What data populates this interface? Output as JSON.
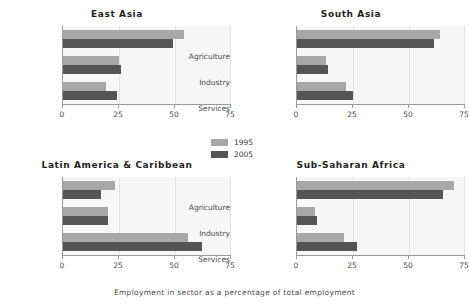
{
  "chart_data": {
    "type": "bar",
    "orientation": "horizontal",
    "title": "",
    "xlabel": "Employment in sector as a percentage of total employment",
    "ylabel": "",
    "xlim": [
      0,
      75
    ],
    "xticks": [
      0,
      25,
      50,
      75
    ],
    "xtick_labels": [
      "0",
      "25",
      "50",
      "75"
    ],
    "categories": [
      "Agriculture",
      "Industry",
      "Services"
    ],
    "legend": {
      "position": "center",
      "entries": [
        {
          "name": "1995",
          "color": "#a8a8a8"
        },
        {
          "name": "2005",
          "color": "#555555"
        }
      ]
    },
    "grid": true,
    "panels": [
      {
        "title": "East Asia",
        "series": [
          {
            "name": "1995",
            "values": [
              54,
              25,
              19
            ]
          },
          {
            "name": "2005",
            "values": [
              49,
              26,
              24
            ]
          }
        ]
      },
      {
        "title": "South Asia",
        "series": [
          {
            "name": "1995",
            "values": [
              64,
              13,
              22
            ]
          },
          {
            "name": "2005",
            "values": [
              61,
              14,
              25
            ]
          }
        ]
      },
      {
        "title": "Latin America & Caribbean",
        "series": [
          {
            "name": "1995",
            "values": [
              23,
              20,
              56
            ]
          },
          {
            "name": "2005",
            "values": [
              17,
              20,
              62
            ]
          }
        ]
      },
      {
        "title": "Sub-Saharan Africa",
        "series": [
          {
            "name": "1995",
            "values": [
              70,
              8,
              21
            ]
          },
          {
            "name": "2005",
            "values": [
              65,
              9,
              27
            ]
          }
        ]
      }
    ]
  },
  "colors": {
    "bar_1995": "#a8a8a8",
    "bar_2005": "#555555",
    "panel_background": "#f7f7f7",
    "axis": "#9a9a9a",
    "gridline": "#e2e2e2",
    "text": "#3b3b3b",
    "page_background": "#ffffff"
  }
}
